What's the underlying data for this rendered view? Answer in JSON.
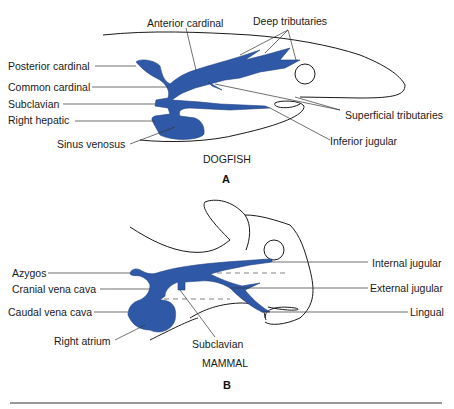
{
  "colors": {
    "vein": "#2f58a6",
    "outline": "#1a1a1a",
    "rule": "#777777"
  },
  "panelA": {
    "caption": "DOGFISH",
    "panel_letter": "A",
    "labels": {
      "anterior_cardinal": "Anterior cardinal",
      "deep_tributaries": "Deep tributaries",
      "posterior_cardinal": "Posterior cardinal",
      "common_cardinal": "Common cardinal",
      "subclavian": "Subclavian",
      "right_hepatic": "Right  hepatic",
      "sinus_venosus": "Sinus venosus",
      "superficial_tributaries": "Superficial tributaries",
      "inferior_jugular": "Inferior jugular"
    }
  },
  "panelB": {
    "caption": "MAMMAL",
    "panel_letter": "B",
    "labels": {
      "azygos": "Azygos",
      "cranial_vena_cava": "Cranial vena cava",
      "caudal_vena_cava": "Caudal vena cava",
      "right_atrium": "Right  atrium",
      "subclavian": "Subclavian",
      "internal_jugular": "Internal jugular",
      "external_jugular": "External jugular",
      "lingual": "Lingual"
    }
  }
}
